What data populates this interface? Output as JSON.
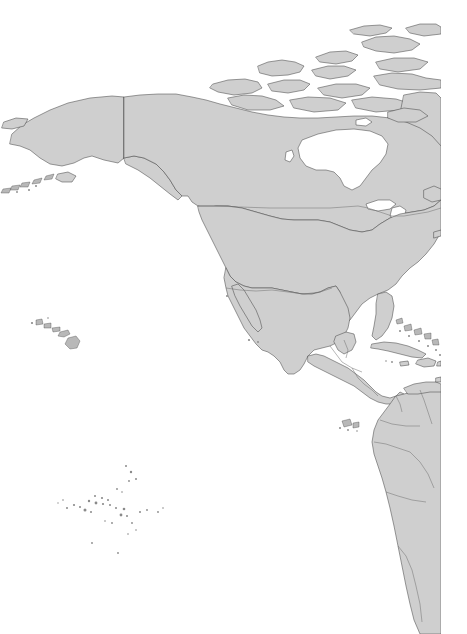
{
  "app": {
    "title": "World Map — North America & Pacific",
    "type": "static-map-image"
  },
  "map": {
    "projection_note": "equirectangular-like world basemap, cropped",
    "canvas_width": 467,
    "canvas_height": 634,
    "content_right_edge": 441,
    "background_color": "#ffffff",
    "land_fill_color": "#cfcfcf",
    "land_stroke_color": "#4a4a4a",
    "border_stroke_color": "#6e6e6e",
    "lake_fill_color": "#ffffff",
    "islet_fill_color": "#b8b8b8",
    "has_labels": false,
    "has_graticule": false,
    "has_legend": false,
    "has_scale_bar": false
  },
  "regions": [
    {
      "id": "alaska",
      "name": "Alaska"
    },
    {
      "id": "aleutian-islands",
      "name": "Aleutian Islands"
    },
    {
      "id": "canada-mainland",
      "name": "Canada"
    },
    {
      "id": "canadian-arctic-archipelago",
      "name": "Canadian Arctic Archipelago"
    },
    {
      "id": "greenland",
      "name": "Greenland"
    },
    {
      "id": "hudson-bay",
      "name": "Hudson Bay"
    },
    {
      "id": "great-lakes",
      "name": "Great Lakes"
    },
    {
      "id": "united-states",
      "name": "United States"
    },
    {
      "id": "hawaii",
      "name": "Hawaiian Islands"
    },
    {
      "id": "mexico",
      "name": "Mexico"
    },
    {
      "id": "baja-california",
      "name": "Baja California"
    },
    {
      "id": "central-america",
      "name": "Central America"
    },
    {
      "id": "cuba",
      "name": "Cuba"
    },
    {
      "id": "bahamas",
      "name": "Bahamas"
    },
    {
      "id": "hispaniola",
      "name": "Hispaniola"
    },
    {
      "id": "jamaica",
      "name": "Jamaica"
    },
    {
      "id": "lesser-antilles",
      "name": "Lesser Antilles"
    },
    {
      "id": "south-america",
      "name": "South America"
    },
    {
      "id": "galapagos-islands",
      "name": "Galápagos Islands"
    },
    {
      "id": "pacific-islands",
      "name": "Pacific Islands"
    }
  ],
  "political_borders": [
    {
      "id": "alaska-canada-border",
      "name": "Alaska / Canada border"
    },
    {
      "id": "usa-canada-border",
      "name": "United States / Canada border"
    },
    {
      "id": "usa-mexico-border",
      "name": "United States / Mexico border"
    },
    {
      "id": "central-america-borders",
      "name": "Central American national borders"
    },
    {
      "id": "south-america-borders",
      "name": "South American national borders"
    }
  ]
}
